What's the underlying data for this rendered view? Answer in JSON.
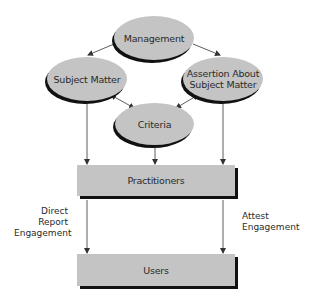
{
  "diagram": {
    "nodes": {
      "management": "Management",
      "subject_matter": "Subject Matter",
      "assertion_line1": "Assertion About",
      "assertion_line2": "Subject Matter",
      "criteria": "Criteria",
      "practitioners": "Practitioners",
      "users": "Users"
    },
    "edge_labels": {
      "direct_line1": "Direct",
      "direct_line2": "Report",
      "direct_line3": "Engagement",
      "attest_line1": "Attest",
      "attest_line2": "Engagement"
    },
    "edges": [
      {
        "from": "Management",
        "to": "Subject Matter",
        "type": "arrow"
      },
      {
        "from": "Management",
        "to": "Assertion About Subject Matter",
        "type": "arrow"
      },
      {
        "from": "Subject Matter",
        "to": "Criteria",
        "type": "bidirectional"
      },
      {
        "from": "Assertion About Subject Matter",
        "to": "Criteria",
        "type": "bidirectional"
      },
      {
        "from": "Subject Matter",
        "to": "Practitioners",
        "type": "arrow"
      },
      {
        "from": "Criteria",
        "to": "Practitioners",
        "type": "arrow"
      },
      {
        "from": "Assertion About Subject Matter",
        "to": "Practitioners",
        "type": "arrow"
      },
      {
        "from": "Practitioners",
        "to": "Users",
        "type": "arrow",
        "label": "Direct Report Engagement"
      },
      {
        "from": "Practitioners",
        "to": "Users",
        "type": "arrow",
        "label": "Attest Engagement"
      }
    ],
    "colors": {
      "node_fill": "#c4c4c4",
      "shadow": "#111111",
      "line": "#333333",
      "text": "#2a2a2a"
    }
  }
}
